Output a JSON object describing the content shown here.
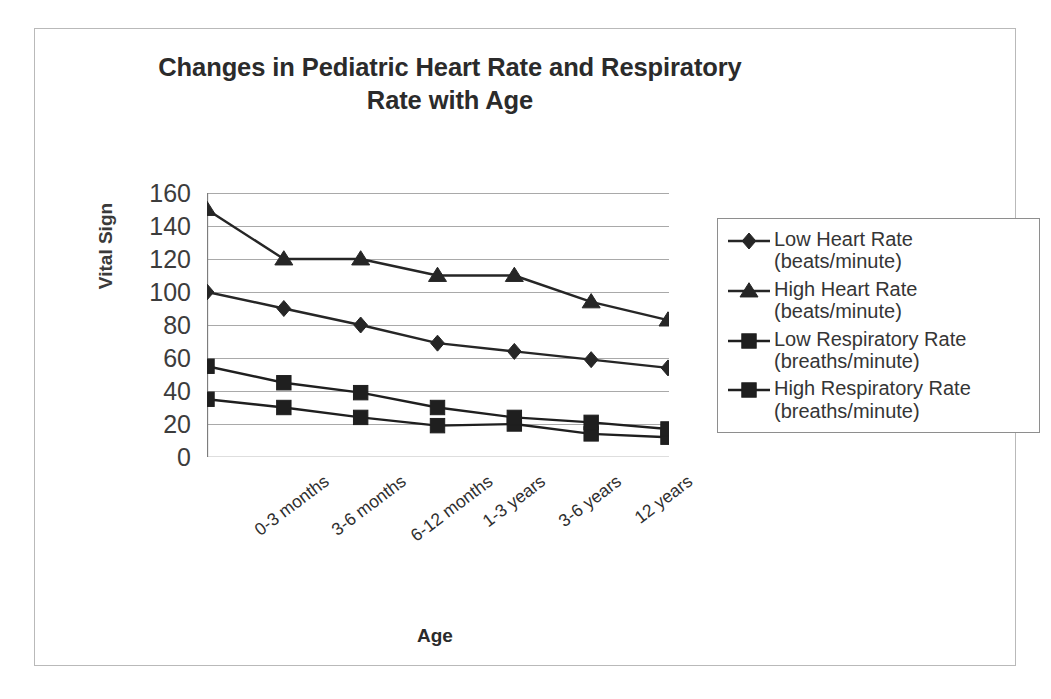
{
  "chart_data": {
    "type": "line",
    "title": "Changes in Pediatric Heart Rate and Respiratory Rate with Age",
    "title_line1": "Changes in Pediatric Heart Rate and Respiratory",
    "title_line2": "Rate with Age",
    "xlabel": "Age",
    "ylabel": "Vital Sign",
    "ylim": [
      0,
      160
    ],
    "ytick_step": 20,
    "grid": true,
    "legend_position": "right",
    "categories": [
      "0-3 months",
      "3-6 months",
      "6-12 months",
      "1-3 years",
      "3-6 years",
      "12 years",
      ""
    ],
    "yticks": [
      "160",
      "140",
      "120",
      "100",
      "80",
      "60",
      "40",
      "20",
      "0"
    ],
    "series": [
      {
        "name": "Low Heart Rate (beats/minute)",
        "name_line1": "Low Heart Rate",
        "name_line2": "(beats/minute)",
        "marker": "diamond",
        "color": "#262626",
        "values": [
          100,
          90,
          80,
          69,
          64,
          59,
          54
        ]
      },
      {
        "name": "High Heart Rate (beats/minute)",
        "name_line1": "High Heart Rate",
        "name_line2": "(beats/minute)",
        "marker": "triangle",
        "color": "#262626",
        "values": [
          150,
          120,
          120,
          110,
          110,
          94,
          83
        ]
      },
      {
        "name": "Low Respiratory Rate (breaths/minute)",
        "name_line1": "Low Respiratory Rate",
        "name_line2": "(breaths/minute)",
        "marker": "square",
        "color": "#1f1f1f",
        "values": [
          35,
          30,
          24,
          19,
          20,
          14,
          12
        ]
      },
      {
        "name": "High Respiratory Rate (breaths/minute)",
        "name_line1": "High Respiratory Rate",
        "name_line2": "(breaths/minute)",
        "marker": "square",
        "color": "#1f1f1f",
        "values": [
          55,
          45,
          39,
          30,
          24,
          21,
          17
        ]
      }
    ]
  },
  "colors": {
    "line": "#262626",
    "grid": "#a9a9a9",
    "axis": "#7d7d7d",
    "frame": "#b9b9b9",
    "text": "#2b2b2b"
  }
}
